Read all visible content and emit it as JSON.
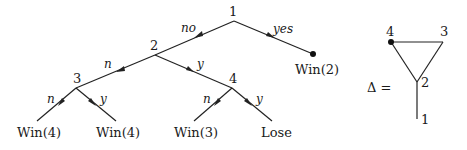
{
  "game_tree": {
    "nodes": [
      {
        "id": "1",
        "label": "1",
        "x": 234,
        "y": 21
      },
      {
        "id": "2",
        "label": "2",
        "x": 155,
        "y": 55
      },
      {
        "id": "3",
        "label": "3",
        "x": 76,
        "y": 88
      },
      {
        "id": "4",
        "label": "4",
        "x": 232,
        "y": 88
      }
    ],
    "edges": [
      {
        "from": "1",
        "to": "2",
        "label": "no"
      },
      {
        "from": "1",
        "to": "win2",
        "label": "yes"
      },
      {
        "from": "2",
        "to": "3",
        "label": "n"
      },
      {
        "from": "2",
        "to": "4",
        "label": "y"
      },
      {
        "from": "3",
        "to": "leaf1",
        "label": "n"
      },
      {
        "from": "3",
        "to": "leaf2",
        "label": "y"
      },
      {
        "from": "4",
        "to": "leaf3",
        "label": "n"
      },
      {
        "from": "4",
        "to": "leaf4",
        "label": "y"
      }
    ],
    "outcomes": {
      "win2": "Win(2)",
      "leaf1": "Win(4)",
      "leaf2": "Win(4)",
      "leaf3": "Win(3)",
      "leaf4": "Lose"
    }
  },
  "delta_graph": {
    "label": "Δ =",
    "vertices": [
      {
        "id": "4",
        "label": "4",
        "marked": true
      },
      {
        "id": "3",
        "label": "3",
        "marked": false
      },
      {
        "id": "2",
        "label": "2",
        "marked": false
      },
      {
        "id": "1",
        "label": "1",
        "marked": false
      }
    ],
    "edges": [
      [
        "4",
        "3"
      ],
      [
        "4",
        "2"
      ],
      [
        "3",
        "2"
      ],
      [
        "2",
        "1"
      ]
    ]
  }
}
